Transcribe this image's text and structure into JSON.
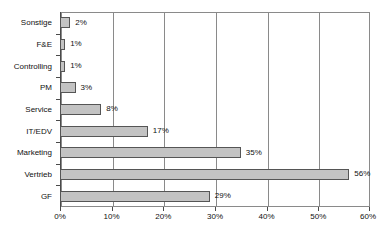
{
  "chart_data": {
    "type": "bar",
    "orientation": "horizontal",
    "title": "",
    "subtitle": "",
    "xlabel": "",
    "ylabel": "",
    "categories": [
      "Sonstige",
      "F&E",
      "Controlling",
      "PM",
      "Service",
      "IT/EDV",
      "Marketing",
      "Vertrieb",
      "GF"
    ],
    "values": [
      2,
      1,
      1,
      3,
      8,
      17,
      35,
      56,
      29
    ],
    "value_labels": [
      "2%",
      "1%",
      "1%",
      "3%",
      "8%",
      "17%",
      "35%",
      "56%",
      "29%"
    ],
    "xlim": [
      0,
      60
    ],
    "xticks": [
      0,
      10,
      20,
      30,
      40,
      50,
      60
    ],
    "xtick_labels": [
      "0%",
      "10%",
      "20%",
      "30%",
      "40%",
      "50%",
      "60%"
    ],
    "grid": "vertical",
    "legend": "none",
    "bar_fill_color": "#c3c3c3",
    "bar_border_color": "#555555",
    "axis_color": "#4a4a4a",
    "grid_color": "#8a8a8a",
    "background_color": "#ffffff"
  }
}
